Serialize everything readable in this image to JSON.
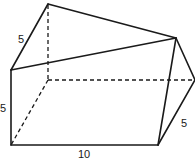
{
  "figure": {
    "type": "3d-solid-wireframe",
    "labels": [
      {
        "id": "slant_top_left",
        "text": "5"
      },
      {
        "id": "front_height",
        "text": "5"
      },
      {
        "id": "bottom_length",
        "text": "10"
      },
      {
        "id": "right_slant",
        "text": "5"
      }
    ],
    "colors": {
      "stroke": "#1a1a1a",
      "background": "#ffffff"
    }
  }
}
